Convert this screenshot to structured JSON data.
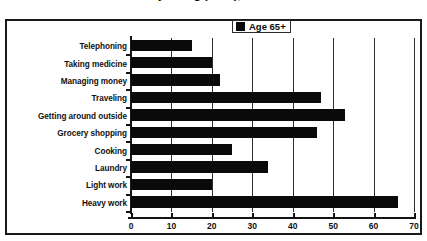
{
  "title": {
    "line_visible": "of Daily Living (IADL), 1982–1984."
  },
  "legend": {
    "entries": [
      {
        "label": "Age 65+",
        "color": "#0a0a0a",
        "swatch_icon": "square-swatch-icon"
      }
    ],
    "position": "top-center-inside"
  },
  "axis": {
    "x_ticks": [
      "0",
      "10",
      "20",
      "30",
      "40",
      "50",
      "60",
      "70"
    ],
    "x_min": 0,
    "x_max": 70,
    "x_step": 10
  },
  "colors": {
    "bar": "#0a0a0a",
    "grid": "#2d2d2d",
    "frame": "#1a1a1a",
    "text": "#111111",
    "background": "#ffffff"
  },
  "chart_data": {
    "type": "bar",
    "orientation": "horizontal",
    "title": "of Daily Living (IADL), 1982–1984.",
    "xlabel": "",
    "ylabel": "",
    "xlim": [
      0,
      70
    ],
    "xticks": [
      0,
      10,
      20,
      30,
      40,
      50,
      60,
      70
    ],
    "grid": true,
    "grid_axis": "x",
    "legend": [
      "Age 65+"
    ],
    "legend_position": "top-center",
    "categories": [
      "Telephoning",
      "Taking medicine",
      "Managing money",
      "Traveling",
      "Getting around outside",
      "Grocery shopping",
      "Cooking",
      "Laundry",
      "Light work",
      "Heavy work"
    ],
    "series": [
      {
        "name": "Age 65+",
        "color": "#0a0a0a",
        "values": [
          15,
          20,
          22,
          47,
          53,
          46,
          25,
          34,
          20,
          66
        ]
      }
    ]
  }
}
